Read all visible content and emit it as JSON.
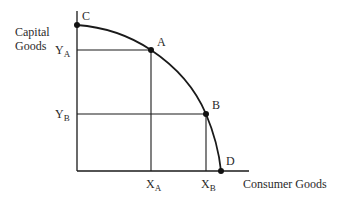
{
  "diagram": {
    "y_axis_label": [
      "Capital",
      "Goods"
    ],
    "x_axis_label": "Consumer Goods",
    "points": [
      {
        "name": "C",
        "x": 77,
        "y": 25
      },
      {
        "name": "A",
        "x": 151,
        "y": 50
      },
      {
        "name": "B",
        "x": 206,
        "y": 114
      },
      {
        "name": "D",
        "x": 221,
        "y": 171
      }
    ],
    "y_ticks": [
      {
        "main": "Y",
        "sub": "A"
      },
      {
        "main": "Y",
        "sub": "B"
      }
    ],
    "x_ticks": [
      {
        "main": "X",
        "sub": "A"
      },
      {
        "main": "X",
        "sub": "B"
      }
    ],
    "colors": {
      "line": "#1a1a1a",
      "point": "#111111",
      "background": "#ffffff"
    }
  }
}
